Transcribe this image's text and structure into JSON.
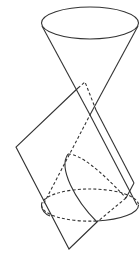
{
  "diagram": {
    "title": "",
    "stroke_color": "#333333",
    "background": "#ffffff",
    "elements": [
      {
        "name": "upper-nappe-ellipse",
        "type": "ellipse",
        "cx": 90,
        "cy": 23,
        "rx": 49,
        "ry": 16,
        "style": "solid"
      },
      {
        "name": "lower-nappe-ellipse",
        "type": "ellipse",
        "cx": 90,
        "cy": 205,
        "rx": 49,
        "ry": 16,
        "style": "solid-front/dashed-back"
      },
      {
        "name": "cone-generator-left",
        "type": "line",
        "from": [
          42,
          25
        ],
        "to": [
          137,
          205
        ]
      },
      {
        "name": "cone-generator-right",
        "type": "line",
        "from": [
          138,
          25
        ],
        "to": [
          43,
          205
        ]
      },
      {
        "name": "cutting-plane",
        "type": "polygon",
        "points": [
          [
            85,
            82
          ],
          [
            16,
            147
          ],
          [
            69,
            249
          ],
          [
            134,
            183
          ]
        ]
      },
      {
        "name": "parabola-section",
        "type": "curve",
        "style": "solid-front/dashed-back"
      }
    ]
  }
}
